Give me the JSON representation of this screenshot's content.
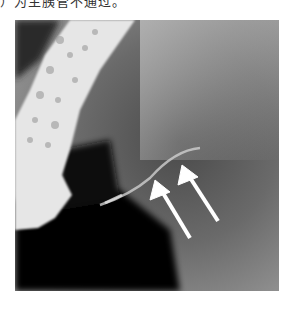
{
  "caption": {
    "text": "）为主胰管不通过。"
  },
  "image": {
    "type": "radiograph",
    "description": "X-ray image with contrast-filled colon on left and two white arrows pointing at a thin duct",
    "arrows": [
      {
        "name": "arrow-1",
        "tip": [
          155,
          180
        ],
        "tail": [
          190,
          238
        ]
      },
      {
        "name": "arrow-2",
        "tip": [
          182,
          165
        ],
        "tail": [
          218,
          221
        ]
      }
    ]
  }
}
